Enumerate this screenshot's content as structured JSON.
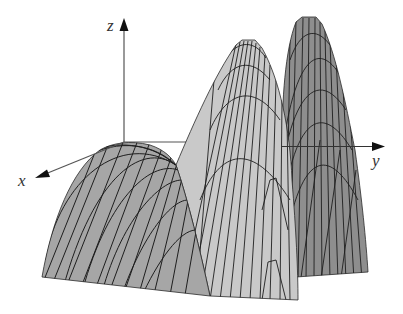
{
  "figure": {
    "type": "3d-surface-plot",
    "axes": {
      "x": {
        "label": "x",
        "origin": [
          124,
          142
        ],
        "tip": [
          36,
          178
        ],
        "label_pos": [
          18,
          172
        ]
      },
      "y": {
        "label": "y",
        "origin": [
          124,
          142
        ],
        "tip": [
          384,
          147
        ],
        "label_pos": [
          372,
          152
        ]
      },
      "z": {
        "label": "z",
        "origin": [
          124,
          142
        ],
        "tip": [
          124,
          20
        ],
        "label_pos": [
          107,
          17
        ]
      }
    },
    "colors": {
      "background": "#ffffff",
      "axis": "#555555",
      "mesh_line": "#1e1e1e",
      "dome_fill": "#a6a6a6",
      "light_peak_fill": "#c9c9c9",
      "dark_peak_fill": "#8e8e8e"
    },
    "regions": [
      {
        "name": "front-dome",
        "fill_key": "dome_fill",
        "top": [
          124,
          142
        ]
      },
      {
        "name": "light-peak",
        "fill_key": "light_peak_fill",
        "top": [
          248,
          43
        ]
      },
      {
        "name": "dark-peak",
        "fill_key": "dark_peak_fill",
        "top": [
          308,
          18
        ]
      }
    ],
    "saddle_point": [
      176,
      165
    ]
  }
}
